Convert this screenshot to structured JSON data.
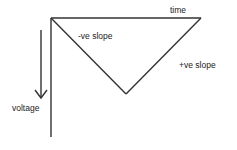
{
  "diagram": {
    "labels": {
      "time_axis": "time",
      "voltage_axis": "voltage",
      "negative_slope": "-ve slope",
      "positive_slope": "+ve slope"
    },
    "colors": {
      "line": "#333333",
      "text": "#222222",
      "background": "#ffffff"
    }
  }
}
